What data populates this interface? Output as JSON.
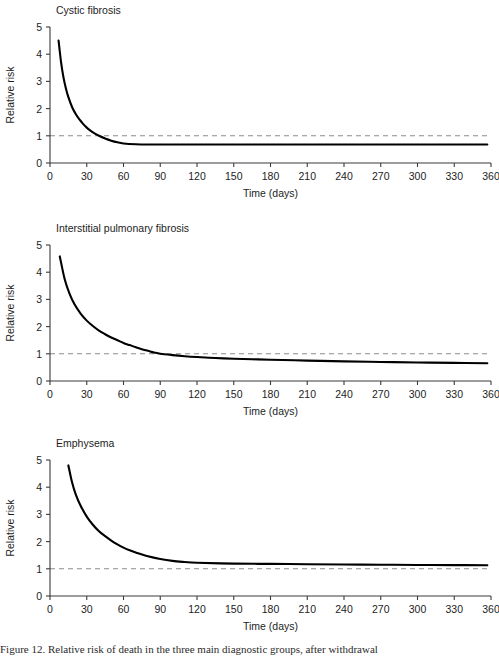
{
  "figure": {
    "background": "#ffffff",
    "curve_color": "#000000",
    "axis_color": "#3a3a3a",
    "reference_color": "#8c8c8c",
    "text_color": "#1d1d1d"
  },
  "axes": {
    "xlabel": "Time (days)",
    "ylabel": "Relative risk",
    "xlim": [
      0,
      360
    ],
    "ylim": [
      0,
      5
    ],
    "xticks": [
      0,
      30,
      60,
      90,
      120,
      150,
      180,
      210,
      240,
      270,
      300,
      330,
      360
    ],
    "yticks": [
      0,
      1,
      2,
      3,
      4,
      5
    ],
    "xtick_labels": [
      "0",
      "30",
      "60",
      "90",
      "120",
      "150",
      "180",
      "210",
      "240",
      "270",
      "300",
      "330",
      "360"
    ],
    "ytick_labels": [
      "0",
      "1",
      "2",
      "3",
      "4",
      "5"
    ],
    "grid": false,
    "reference_line_y": 1
  },
  "caption": {
    "text": "Figure 12. Relative risk of death in the three main diagnostic groups, after withdrawal"
  },
  "chart_data": [
    {
      "type": "line",
      "title": "Cystic fibrosis",
      "xlabel": "Time (days)",
      "ylabel": "Relative risk",
      "xlim": [
        0,
        360
      ],
      "ylim": [
        0,
        5
      ],
      "grid": false,
      "reference_line_y": 1,
      "x": [
        7,
        9,
        11,
        13,
        15,
        18,
        21,
        24,
        27,
        30,
        33,
        36,
        40,
        45,
        50,
        55,
        60,
        70,
        80,
        90,
        120,
        150,
        180,
        210,
        240,
        270,
        300,
        330,
        357
      ],
      "y": [
        4.5,
        3.72,
        3.15,
        2.74,
        2.42,
        2.06,
        1.8,
        1.6,
        1.44,
        1.3,
        1.19,
        1.1,
        1.0,
        0.9,
        0.82,
        0.76,
        0.72,
        0.69,
        0.68,
        0.68,
        0.68,
        0.68,
        0.68,
        0.68,
        0.68,
        0.68,
        0.68,
        0.68,
        0.68
      ],
      "crosses_reference_at_x": 33,
      "asymptote_y": 0.68,
      "start_point": {
        "x": 7,
        "y": 4.5
      },
      "end_point": {
        "x": 357,
        "y": 0.68
      }
    },
    {
      "type": "line",
      "title": "Interstitial pulmonary fibrosis",
      "xlabel": "Time (days)",
      "ylabel": "Relative risk",
      "xlim": [
        0,
        360
      ],
      "ylim": [
        0,
        5
      ],
      "grid": false,
      "reference_line_y": 1,
      "x": [
        8,
        12,
        16,
        20,
        25,
        30,
        35,
        40,
        45,
        50,
        55,
        60,
        65,
        70,
        75,
        80,
        85,
        90,
        100,
        110,
        120,
        135,
        150,
        165,
        180,
        210,
        240,
        270,
        300,
        330,
        357
      ],
      "y": [
        4.58,
        3.74,
        3.2,
        2.82,
        2.48,
        2.22,
        2.02,
        1.85,
        1.72,
        1.6,
        1.5,
        1.4,
        1.32,
        1.24,
        1.17,
        1.11,
        1.05,
        1.0,
        0.95,
        0.91,
        0.88,
        0.845,
        0.82,
        0.8,
        0.78,
        0.75,
        0.72,
        0.7,
        0.68,
        0.665,
        0.65
      ],
      "crosses_reference_at_x": 90,
      "asymptote_y": 0.65,
      "start_point": {
        "x": 8,
        "y": 4.58
      },
      "end_point": {
        "x": 357,
        "y": 0.65
      }
    },
    {
      "type": "line",
      "title": "Emphysema",
      "xlabel": "Time (days)",
      "ylabel": "Relative risk",
      "xlim": [
        0,
        360
      ],
      "ylim": [
        0,
        5
      ],
      "grid": false,
      "reference_line_y": 1,
      "x": [
        15,
        18,
        21,
        25,
        30,
        35,
        40,
        45,
        50,
        55,
        60,
        65,
        70,
        80,
        90,
        100,
        110,
        120,
        150,
        180,
        210,
        240,
        270,
        300,
        330,
        357
      ],
      "y": [
        4.8,
        4.18,
        3.74,
        3.32,
        2.92,
        2.62,
        2.38,
        2.2,
        2.04,
        1.9,
        1.78,
        1.68,
        1.6,
        1.46,
        1.36,
        1.29,
        1.25,
        1.22,
        1.19,
        1.18,
        1.17,
        1.16,
        1.15,
        1.14,
        1.135,
        1.13
      ],
      "crosses_reference_at_x": null,
      "asymptote_y": 1.13,
      "start_point": {
        "x": 15,
        "y": 4.8
      },
      "end_point": {
        "x": 357,
        "y": 1.13
      }
    }
  ]
}
